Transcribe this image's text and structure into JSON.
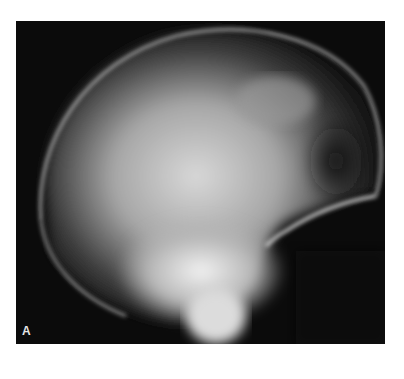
{
  "figure": {
    "panel_label": "A",
    "colors": {
      "background": "#0b0b0b",
      "page": "#ffffff"
    }
  }
}
